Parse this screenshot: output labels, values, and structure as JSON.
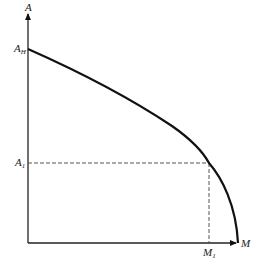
{
  "diagram": {
    "axes": {
      "y_label": "A",
      "x_label": "M"
    },
    "labels": {
      "y_intercept": {
        "main": "A",
        "sub": "H"
      },
      "y_mark": {
        "main": "A",
        "sub": "1"
      },
      "x_mark": {
        "main": "M",
        "sub": "1"
      }
    },
    "colors": {
      "line": "#111111",
      "dashed": "#555555",
      "background": "#ffffff"
    }
  }
}
